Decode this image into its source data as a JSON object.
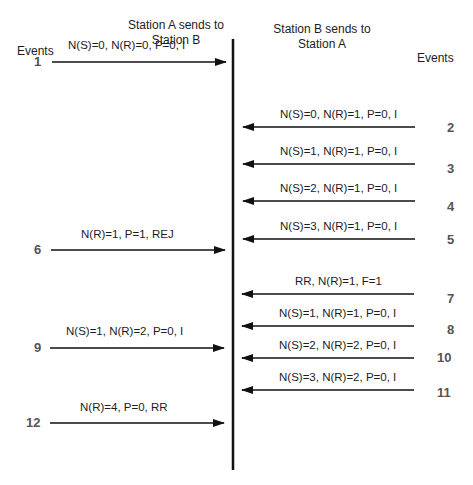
{
  "headers": {
    "station_a": "Station A sends to\nStation B",
    "station_a_line1": "Station A sends to",
    "station_a_line2": "Station B",
    "station_b_line1": "Station B sends to",
    "station_b_line2": "Station A",
    "events_left": "Events",
    "events_right": "Events"
  },
  "a_to_b": [
    {
      "event": "1",
      "label": "N(S)=0, N(R)=0, P=0, I",
      "y": 62
    },
    {
      "event": "6",
      "label": "N(R)=1, P=1, REJ",
      "y": 250
    },
    {
      "event": "9",
      "label": "N(S)=1, N(R)=2, P=0, I",
      "y": 348
    },
    {
      "event": "12",
      "label": "N(R)=4, P=0, RR",
      "y": 423
    }
  ],
  "b_to_a": [
    {
      "event": "2",
      "label": "N(S)=0, N(R)=1, P=0, I",
      "y": 127
    },
    {
      "event": "3",
      "label": "N(S)=1, N(R)=1, P=0, I",
      "y": 164
    },
    {
      "event": "4",
      "label": "N(S)=2, N(R)=1, P=0, I",
      "y": 201
    },
    {
      "event": "5",
      "label": "N(S)=3, N(R)=1, P=0, I",
      "y": 239
    },
    {
      "event": "7",
      "label": "RR, N(R)=1, F=1",
      "y": 294
    },
    {
      "event": "8",
      "label": "N(S)=1, N(R)=1, P=0, I",
      "y": 326
    },
    {
      "event": "10",
      "label": "N(S)=2, N(R)=2, P=0, I",
      "y": 358
    },
    {
      "event": "11",
      "label": "N(S)=3, N(R)=2, P=0, I",
      "y": 390
    }
  ]
}
